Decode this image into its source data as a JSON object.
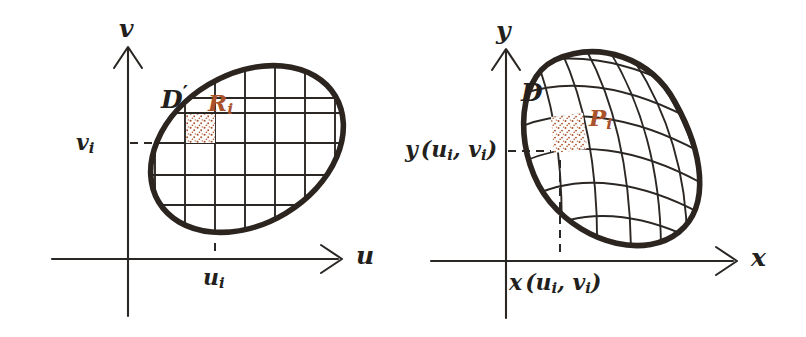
{
  "figure": {
    "background_color": "#ffffff",
    "ink_color": "#231f1d",
    "accent_color": "#a9522c"
  },
  "panels": [
    {
      "id": "uv",
      "name": "uv-plane",
      "axes": {
        "horizontal_label": "u",
        "vertical_label": "v",
        "origin_label": ""
      },
      "region": {
        "label": "D",
        "label_prime": "′",
        "label_full": "D′",
        "shape": "ellipse",
        "grid": "rectangular"
      },
      "cell": {
        "label": "R",
        "subscript": "i",
        "label_full": "Rᵢ",
        "fill": "stippled"
      },
      "ticks": [
        {
          "name": "u-tick",
          "label": "u",
          "subscript": "i",
          "label_full": "uᵢ",
          "axis": "horizontal"
        },
        {
          "name": "v-tick",
          "label": "v",
          "subscript": "i",
          "label_full": "vᵢ",
          "axis": "vertical"
        }
      ]
    },
    {
      "id": "xy",
      "name": "xy-plane",
      "axes": {
        "horizontal_label": "x",
        "vertical_label": "y",
        "origin_label": ""
      },
      "region": {
        "label": "D",
        "label_prime": "",
        "label_full": "D",
        "shape": "oval",
        "grid": "curvilinear"
      },
      "cell": {
        "label": "P",
        "subscript": "i",
        "label_full": "Pᵢ",
        "fill": "stippled"
      },
      "ticks": [
        {
          "name": "x-tick",
          "label": "x",
          "args_open": "(",
          "arg1": "u",
          "arg1_sub": "i",
          "comma": ", ",
          "arg2": "v",
          "arg2_sub": "i",
          "args_close": ")",
          "label_full": "x (uᵢ, vᵢ)",
          "axis": "horizontal"
        },
        {
          "name": "y-tick",
          "label": "y",
          "args_open": "(",
          "arg1": "u",
          "arg1_sub": "i",
          "comma": ", ",
          "arg2": "v",
          "arg2_sub": "i",
          "args_close": ")",
          "label_full": "y (uᵢ, vᵢ)",
          "axis": "vertical"
        }
      ]
    }
  ]
}
